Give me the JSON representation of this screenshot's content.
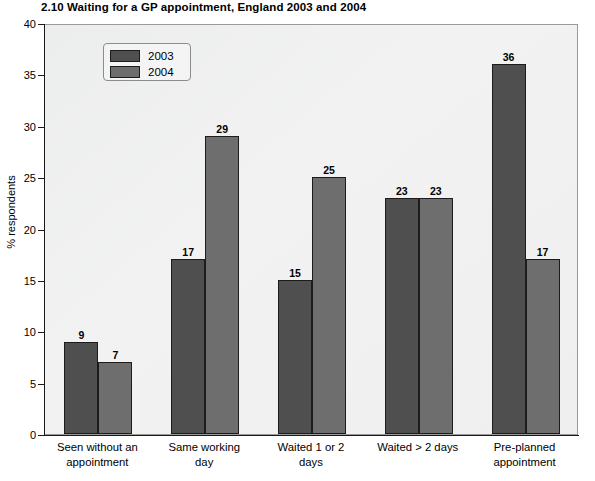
{
  "chart_data": {
    "type": "bar",
    "title": "2.10  Waiting for a GP appointment, England 2003 and 2004",
    "xlabel": "",
    "ylabel": "% respondents",
    "ylim": [
      0,
      40
    ],
    "yticks": [
      0,
      5,
      10,
      15,
      20,
      25,
      30,
      35,
      40
    ],
    "grid": false,
    "legend_position": "upper-left-inside",
    "categories": [
      "Seen without an\nappointment",
      "Same working\nday",
      "Waited 1 or 2\ndays",
      "Waited > 2 days",
      "Pre-planned\nappointment"
    ],
    "category_lines": [
      [
        "Seen without an",
        "appointment"
      ],
      [
        "Same working",
        "day"
      ],
      [
        "Waited 1 or 2",
        "days"
      ],
      [
        "Waited > 2 days",
        ""
      ],
      [
        "Pre-planned",
        "appointment"
      ]
    ],
    "series": [
      {
        "name": "2003",
        "color": "#4f4f4f",
        "values": [
          9,
          17,
          15,
          23,
          36
        ]
      },
      {
        "name": "2004",
        "color": "#6e6e6e",
        "values": [
          7,
          29,
          25,
          23,
          17
        ]
      }
    ]
  },
  "legend": {
    "items": [
      {
        "label": "2003"
      },
      {
        "label": "2004"
      }
    ]
  }
}
